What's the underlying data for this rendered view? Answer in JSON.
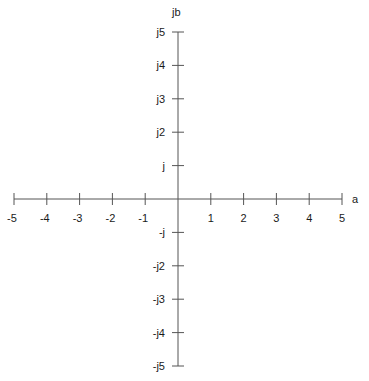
{
  "chart_data": {
    "type": "diagram",
    "title": "",
    "xlabel": "a",
    "ylabel": "jb",
    "xlim": [
      -5,
      5
    ],
    "ylim": [
      -5,
      5
    ],
    "x_ticks": [
      -5,
      -4,
      -3,
      -2,
      -1,
      1,
      2,
      3,
      4,
      5
    ],
    "x_tick_labels": [
      "-5",
      "-4",
      "-3",
      "-2",
      "-1",
      "1",
      "2",
      "3",
      "4",
      "5"
    ],
    "y_ticks": [
      5,
      4,
      3,
      2,
      1,
      -1,
      -2,
      -3,
      -4,
      -5
    ],
    "y_tick_labels": [
      "j5",
      "j4",
      "j3",
      "j2",
      "j",
      "-j",
      "-j2",
      "-j3",
      "-j4",
      "-j5"
    ],
    "grid": false,
    "colors": {
      "axis": "#555555",
      "text": "#1a1a1a"
    }
  }
}
